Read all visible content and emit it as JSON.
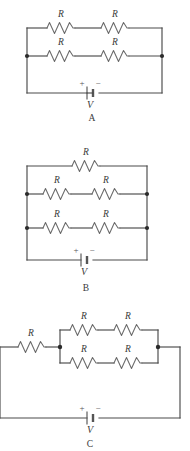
{
  "figure": {
    "type": "circuit-diagram-set",
    "resistor_label": "R",
    "source_label": "V",
    "plus_sign": "+",
    "minus_sign": "−",
    "colors": {
      "wire": "#4a4a4a",
      "resistor": "#6a6a6a",
      "node": "#2b2b2b",
      "text": "#3a3a3a",
      "background": "#ffffff"
    }
  },
  "panels": [
    {
      "id": "A",
      "label": "A",
      "resistor_count": 4,
      "branches": [
        {
          "name": "top-branch",
          "resistors": [
            "R",
            "R"
          ]
        },
        {
          "name": "middle-branch",
          "resistors": [
            "R",
            "R"
          ]
        }
      ],
      "battery": {
        "label": "V",
        "plus": "+",
        "minus": "−"
      },
      "node_count": 2
    },
    {
      "id": "B",
      "label": "B",
      "resistor_count": 5,
      "branches": [
        {
          "name": "top-branch",
          "resistors": [
            "R"
          ]
        },
        {
          "name": "middle-branch",
          "resistors": [
            "R",
            "R"
          ]
        },
        {
          "name": "bottom-branch",
          "resistors": [
            "R",
            "R"
          ]
        }
      ],
      "battery": {
        "label": "V",
        "plus": "+",
        "minus": "−"
      },
      "node_count": 4
    },
    {
      "id": "C",
      "label": "C",
      "resistor_count": 5,
      "branches": [
        {
          "name": "series-branch",
          "resistors": [
            "R"
          ]
        },
        {
          "name": "parallel-top-branch",
          "resistors": [
            "R",
            "R"
          ]
        },
        {
          "name": "parallel-bottom-branch",
          "resistors": [
            "R",
            "R"
          ]
        }
      ],
      "battery": {
        "label": "V",
        "plus": "+",
        "minus": "−"
      },
      "node_count": 2
    }
  ],
  "labels": {
    "panel_a": "A",
    "panel_b": "B",
    "panel_c": "C",
    "r1": "R",
    "r2": "R",
    "r3": "R",
    "r4": "R",
    "r5": "R",
    "r6": "R",
    "r7": "R",
    "r8": "R",
    "r9": "R",
    "r10": "R",
    "r11": "R",
    "r12": "R",
    "r13": "R",
    "r14": "R",
    "v_a": "V",
    "v_b": "V",
    "v_c": "V",
    "plus_a": "+",
    "minus_a": "−",
    "plus_b": "+",
    "minus_b": "−",
    "plus_c": "+",
    "minus_c": "−"
  }
}
